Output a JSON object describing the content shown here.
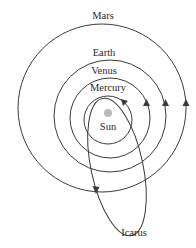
{
  "diagram": {
    "colors": {
      "stroke": "#3a3a3a",
      "sun": "#b8b8b8",
      "text": "#2a2a2a",
      "background": "#ffffff"
    },
    "sun": {
      "label": "Sun"
    },
    "orbits": [
      {
        "name": "Mars",
        "label": "Mars"
      },
      {
        "name": "Earth",
        "label": "Earth"
      },
      {
        "name": "Venus",
        "label": "Venus"
      },
      {
        "name": "Mercury",
        "label": "Mercury"
      }
    ],
    "asteroid": {
      "name": "Icarus",
      "label": "Icarus"
    },
    "direction": "counterclockwise"
  }
}
